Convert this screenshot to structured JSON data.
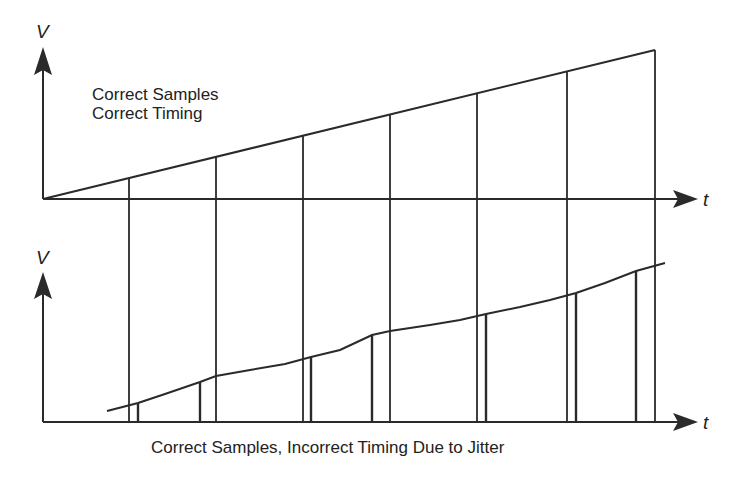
{
  "diagram": {
    "top_panel": {
      "y_axis_label": "V",
      "x_axis_label": "t",
      "caption_line1": "Correct Samples",
      "caption_line2": "Correct Timing"
    },
    "bottom_panel": {
      "y_axis_label": "V",
      "x_axis_label": "t",
      "caption": "Correct Samples, Incorrect Timing Due to Jitter"
    },
    "colors": {
      "line": "#2a2a2a",
      "background": "#ffffff"
    }
  }
}
